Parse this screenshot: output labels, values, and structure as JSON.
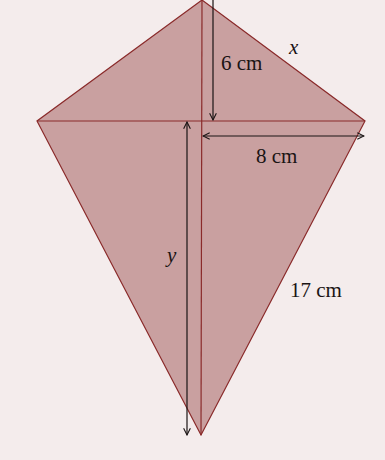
{
  "diagram": {
    "type": "kite",
    "colors": {
      "background": "#f4ecec",
      "fill": "#c9a0a0",
      "edge": "#8a2a2a",
      "arrow": "#1a1414"
    },
    "vertices": {
      "top": [
        202,
        0
      ],
      "left": [
        37,
        121
      ],
      "right": [
        365,
        121
      ],
      "bottom": [
        201,
        435
      ]
    },
    "labels": {
      "top_half_diagonal": "6 cm",
      "top_side": "x",
      "half_cross_diagonal": "8 cm",
      "bottom_half_diagonal": "y",
      "bottom_side": "17 cm"
    }
  }
}
